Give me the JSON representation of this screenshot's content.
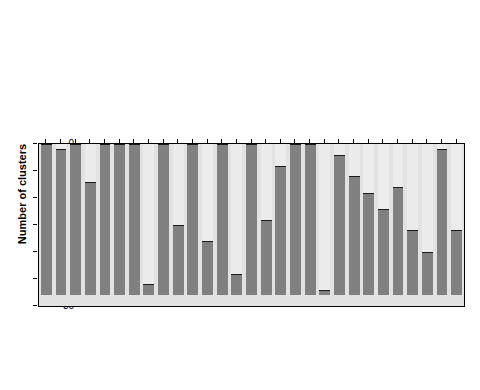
{
  "chart_data": {
    "type": "bar",
    "title": "",
    "subtitle": "",
    "xlabel": "",
    "ylabel": "Number of clusters",
    "ylim": [
      0,
      30
    ],
    "y_inverted": true,
    "yticks": [
      0,
      5,
      10,
      15,
      20,
      25,
      30
    ],
    "ytick_labels": [
      "0",
      "5",
      "10",
      "15",
      "20",
      "25",
      "30"
    ],
    "grid": false,
    "legend": "none",
    "bar_total": 28,
    "categories": [
      "publishes",
      "shares ideas, helpful",
      "uses networks",
      "self promotion",
      "research leader, mentor",
      "finisher",
      "hands-on",
      "neglect other responsibilities",
      "commitment, persistence",
      "strategic",
      "communicates",
      "problem solver",
      "technical skill",
      "breadth of work",
      "explains to others",
      "humility",
      "confident",
      "enthusiasm",
      "analytic, thinker",
      "creative, innovative",
      "methodologically sound",
      "organised, disciplined",
      "careful, thorough",
      "substantive knowledge",
      "curiosity, open mind",
      "intrinsic interest",
      "students",
      "presentations",
      "volume of work"
    ],
    "values": [
      28,
      27,
      28,
      21,
      28,
      28,
      28,
      28,
      28,
      28,
      13,
      28,
      15,
      24,
      28,
      28,
      28,
      28,
      28,
      22,
      28,
      25,
      28,
      28,
      28,
      28,
      28,
      28,
      28
    ],
    "series": [
      {
        "name": "clusters containing attribute",
        "values": [
          28,
          27,
          28,
          21,
          28,
          28,
          28,
          28,
          28,
          28,
          13,
          28,
          15,
          24,
          28,
          28,
          28,
          28,
          28,
          22,
          28,
          25,
          28,
          28,
          28,
          28,
          28,
          28,
          28
        ]
      }
    ],
    "bars": [
      {
        "label": "publishes",
        "start": 0,
        "end": 28
      },
      {
        "label": "shares ideas, helpful",
        "start": 1,
        "end": 28
      },
      {
        "label": "uses networks",
        "start": 0,
        "end": 28
      },
      {
        "label": "self promotion",
        "start": 7,
        "end": 28
      },
      {
        "label": "research leader, mentor",
        "start": 0,
        "end": 28
      },
      {
        "label": "finisher",
        "start": 0,
        "end": 28
      },
      {
        "label": "hands-on",
        "start": 0,
        "end": 28
      },
      {
        "label": "neglect other responsibilities",
        "start": 26,
        "end": 28
      },
      {
        "label": "commitment, persistence",
        "start": 0,
        "end": 28
      },
      {
        "label": "strategic",
        "start": 15,
        "end": 28
      },
      {
        "label": "communicates",
        "start": 0,
        "end": 28
      },
      {
        "label": "problem solver",
        "start": 18,
        "end": 28
      },
      {
        "label": "technical skill",
        "start": 0,
        "end": 28
      },
      {
        "label": "breadth of work",
        "start": 24,
        "end": 28
      },
      {
        "label": "explains to others",
        "start": 0,
        "end": 28
      },
      {
        "label": "humility",
        "start": 14,
        "end": 28
      },
      {
        "label": "confident",
        "start": 4,
        "end": 28
      },
      {
        "label": "enthusiasm",
        "start": 0,
        "end": 28
      },
      {
        "label": "analytic, thinker",
        "start": 0,
        "end": 28
      },
      {
        "label": "creative, innovative",
        "start": 27,
        "end": 28
      },
      {
        "label": "methodologically sound",
        "start": 2,
        "end": 28
      },
      {
        "label": "organised, disciplined",
        "start": 6,
        "end": 28
      },
      {
        "label": "careful, thorough",
        "start": 9,
        "end": 28
      },
      {
        "label": "substantive knowledge",
        "start": 12,
        "end": 28
      },
      {
        "label": "curiosity, open mind",
        "start": 8,
        "end": 28
      },
      {
        "label": "intrinsic interest",
        "start": 16,
        "end": 28
      },
      {
        "label": "students",
        "start": 20,
        "end": 28
      },
      {
        "label": "presentations",
        "start": 1,
        "end": 28
      },
      {
        "label": "volume of work",
        "start": 16,
        "end": 28
      }
    ],
    "colors": {
      "bar_fill": "#808080",
      "bar_edge": "#1a1a1a",
      "bar_remainder": "#ececec",
      "plot_background": "#e2e2e2",
      "axis": "#000000",
      "text": "#000000"
    }
  }
}
